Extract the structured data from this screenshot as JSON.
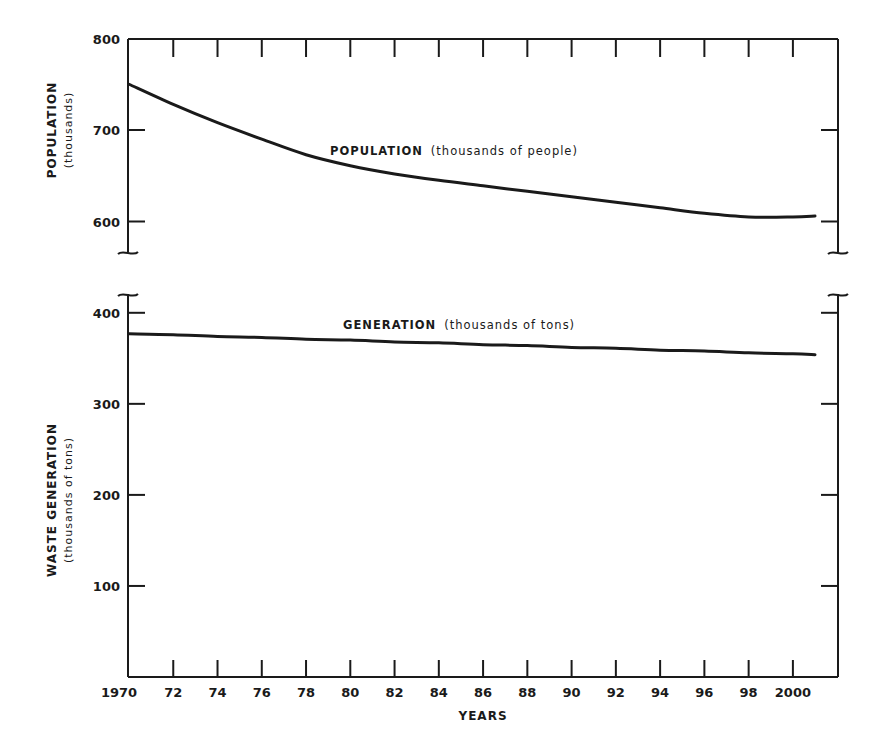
{
  "chart_data": [
    {
      "type": "line",
      "title": "",
      "panel": "top",
      "xlabel": "",
      "ylabel": "POPULATION",
      "ylabel_sub": "(thousands)",
      "ylim": [
        575,
        800
      ],
      "yticks": [
        600,
        700,
        800
      ],
      "ytick_labels": [
        "600",
        "700",
        "800"
      ],
      "axis_break_bottom": true,
      "grid": false,
      "x": [
        1970,
        1972,
        1974,
        1976,
        1978,
        1980,
        1982,
        1984,
        1986,
        1988,
        1990,
        1992,
        1994,
        1996,
        1998,
        2000,
        2001
      ],
      "series": [
        {
          "name": "POPULATION (thousands of people)",
          "label_main": "POPULATION",
          "label_sub": "(thousands of people)",
          "values": [
            750,
            728,
            708,
            690,
            673,
            661,
            652,
            645,
            639,
            633,
            627,
            621,
            615,
            609,
            605,
            605,
            606
          ]
        }
      ]
    },
    {
      "type": "line",
      "title": "",
      "panel": "bottom",
      "xlabel": "YEARS",
      "ylabel": "WASTE GENERATION",
      "ylabel_sub": "(thousands of tons)",
      "ylim": [
        0,
        420
      ],
      "yticks": [
        100,
        200,
        300,
        400
      ],
      "ytick_labels": [
        "100",
        "200",
        "300",
        "400"
      ],
      "axis_break_top": true,
      "grid": false,
      "x": [
        1970,
        1972,
        1974,
        1976,
        1978,
        1980,
        1982,
        1984,
        1986,
        1988,
        1990,
        1992,
        1994,
        1996,
        1998,
        2000,
        2001
      ],
      "xtick_labels": [
        "1970",
        "72",
        "74",
        "76",
        "78",
        "80",
        "82",
        "84",
        "86",
        "88",
        "90",
        "92",
        "94",
        "96",
        "98",
        "2000"
      ],
      "series": [
        {
          "name": "GENERATION (thousands of tons)",
          "label_main": "GENERATION",
          "label_sub": "(thousands of tons)",
          "values": [
            377,
            376,
            374,
            373,
            371,
            370,
            368,
            367,
            365,
            364,
            362,
            361,
            359,
            358,
            356,
            355,
            354
          ]
        }
      ]
    }
  ],
  "colors": {
    "ink": "#1a1a1a",
    "background": "#ffffff"
  }
}
